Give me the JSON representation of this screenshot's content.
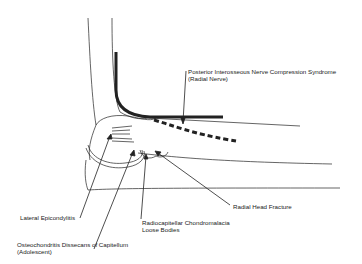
{
  "diagram": {
    "labels": {
      "pin": {
        "line1": "Posterior Interosseous Nerve Compression Syndrome",
        "line2": "(Radial Nerve)"
      },
      "radial_head_fracture": "Radial Head Fracture",
      "lateral_epicondylitis": "Lateral Epicondylitis",
      "radiocapitellar": {
        "line1": "Radiocapitellar Chondromalacia",
        "line2": "Loose Bodies"
      },
      "ocd": {
        "line1": "Osteochondritis Dissecans of Capitellum",
        "line2": "(Adolescent)"
      }
    },
    "colors": {
      "line": "#222222",
      "background": "#ffffff"
    }
  }
}
